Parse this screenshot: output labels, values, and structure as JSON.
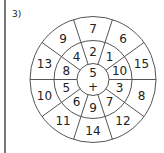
{
  "problem_label": "3)",
  "diagram": {
    "center": "5",
    "operator": "+",
    "inner_ring": [
      "10",
      "1",
      "2",
      "4",
      "8",
      "5",
      "6",
      "9",
      "7",
      "3"
    ],
    "outer_ring": [
      "15",
      "6",
      "7",
      "9",
      "13",
      "10",
      "11",
      "14",
      "12",
      "8"
    ]
  },
  "colors": {
    "line": "#555555",
    "text": "#222222"
  }
}
